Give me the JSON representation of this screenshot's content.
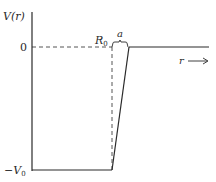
{
  "diagram": {
    "y_axis_label": "V(r)",
    "x_axis_label": "r",
    "zero_label": "0",
    "bottom_label": "−V",
    "bottom_label_sub": "0",
    "radius_label": "R",
    "radius_label_sub": "0",
    "diffuseness_label": "a",
    "arrow_glyph": "⟶",
    "line_color": "#2a2a2a"
  }
}
